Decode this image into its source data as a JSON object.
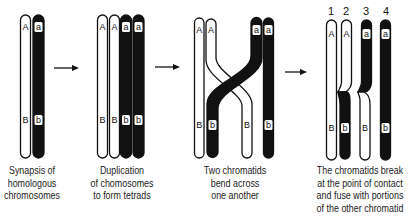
{
  "figure": {
    "panels": [
      {
        "id": "synapsis",
        "caption": [
          "Synapsis of",
          "homologous",
          "chromosomes"
        ],
        "chromatids": [
          {
            "fill": "white",
            "top_label": "A",
            "bottom_label": "B"
          },
          {
            "fill": "black",
            "top_label": "a",
            "bottom_label": "b"
          }
        ]
      },
      {
        "id": "duplication",
        "caption": [
          "Duplication",
          "of chomosomes",
          "to form tetrads"
        ],
        "chromatids": [
          {
            "fill": "white",
            "top_label": "A",
            "bottom_label": "B"
          },
          {
            "fill": "white",
            "top_label": "A",
            "bottom_label": "B"
          },
          {
            "fill": "black",
            "top_label": "a",
            "bottom_label": "b"
          },
          {
            "fill": "black",
            "top_label": "a",
            "bottom_label": "b"
          }
        ]
      },
      {
        "id": "bending",
        "caption": [
          "Two chromatids",
          "bend across",
          "one another"
        ],
        "chromatids": [
          {
            "fill": "white",
            "top_label": "A",
            "bottom_label": "B"
          },
          {
            "fill": "white",
            "top_label": "A",
            "bottom_label": "B",
            "crosses": true
          },
          {
            "fill": "black",
            "top_label": "a",
            "bottom_label": "b",
            "crosses": true
          },
          {
            "fill": "black",
            "top_label": "a",
            "bottom_label": "b"
          }
        ]
      },
      {
        "id": "crossing-over",
        "caption": [
          "The chromatids break",
          "at the point of contact",
          "and fuse with portions",
          "of the other chromatid"
        ],
        "numbers": [
          "1",
          "2",
          "3",
          "4"
        ],
        "chromatids": [
          {
            "fill": "white",
            "top_label": "A",
            "bottom_label": "B"
          },
          {
            "fill": "white-top/black-bottom",
            "top_label": "A",
            "bottom_label": "b"
          },
          {
            "fill": "black-top/white-bottom",
            "top_label": "a",
            "bottom_label": "B"
          },
          {
            "fill": "black",
            "top_label": "a",
            "bottom_label": "b"
          }
        ]
      }
    ],
    "arrows": 3,
    "colors": {
      "ink": "#111111",
      "paper": "#ffffff"
    }
  }
}
